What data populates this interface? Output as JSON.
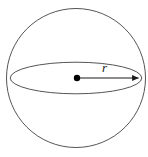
{
  "figure": {
    "name": "sphere-with-radius",
    "background_color": "#ffffff",
    "stroke_color": "#555555",
    "arrow_color": "#1a1a1a",
    "center_dot_color": "#000000",
    "labels": {
      "radius": "r"
    },
    "geometry": {
      "circle": {
        "cx": 76,
        "cy": 78,
        "r": 70
      },
      "equator_ellipse": {
        "cx": 76,
        "cy": 78,
        "rx": 66,
        "ry": 16
      },
      "center_point": {
        "x": 77,
        "y": 78,
        "dot_radius": 3.2
      },
      "radius_arrow": {
        "x1": 77,
        "y1": 78,
        "x2": 141,
        "y2": 78
      },
      "radius_label_position": {
        "x": 107,
        "y": 69
      }
    }
  }
}
